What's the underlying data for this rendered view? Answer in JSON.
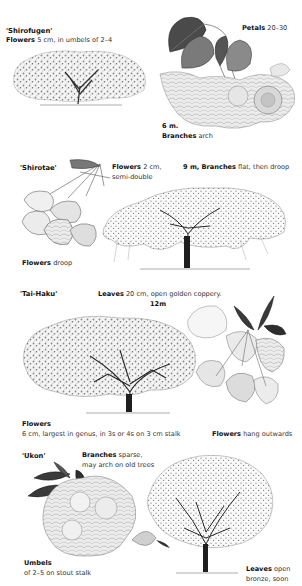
{
  "page": {
    "background": "#ffffff",
    "ink_color": "#2a2a2a"
  },
  "sections": [
    {
      "cultivar": "'Shirofugen'",
      "labels": [
        {
          "bold": "Flowers",
          "text": " 5 cm, in umbels of 2–4"
        },
        {
          "bold": "Petals",
          "text": " 20–30"
        },
        {
          "bold": "6 m.",
          "text": ""
        },
        {
          "bold": "Branches",
          "text": " arch"
        }
      ],
      "illustrations": [
        "tree-icon",
        "leaf-and-flower-spray-icon"
      ]
    },
    {
      "cultivar": "'Shirotae'",
      "labels": [
        {
          "bold": "Flowers",
          "text": " 2 cm,"
        },
        {
          "bold": "",
          "text": "semi-double"
        },
        {
          "bold": "9 m, Branches",
          "text": " flat, then droop"
        },
        {
          "bold": "Flowers",
          "text": " droop"
        }
      ],
      "illustrations": [
        "drooping-flower-cluster-icon",
        "spreading-tree-icon"
      ]
    },
    {
      "cultivar": "'Tai-Haku'",
      "labels": [
        {
          "bold": "Leaves",
          "text": " 20 cm, open golden coppery."
        },
        {
          "bold": "12m",
          "text": ""
        },
        {
          "bold": "Flowers",
          "text": ""
        },
        {
          "bold": "",
          "text": "6 cm, largest in genus, in 3s or 4s on 3 cm stalk"
        },
        {
          "bold": "Flowers",
          "text": " hang outwards"
        }
      ],
      "illustrations": [
        "rounded-tree-icon",
        "large-flower-spray-icon"
      ]
    },
    {
      "cultivar": "'Ukon'",
      "labels": [
        {
          "bold": "Branches",
          "text": " sparse,"
        },
        {
          "bold": "",
          "text": "may arch on old trees"
        },
        {
          "bold": "Umbels",
          "text": ""
        },
        {
          "bold": "",
          "text": "of 2–5 on stout stalk"
        },
        {
          "bold": "Leaves",
          "text": " open"
        },
        {
          "bold": "",
          "text": "bronze, soon"
        }
      ],
      "illustrations": [
        "flower-umbel-icon",
        "upright-tree-icon"
      ]
    }
  ]
}
